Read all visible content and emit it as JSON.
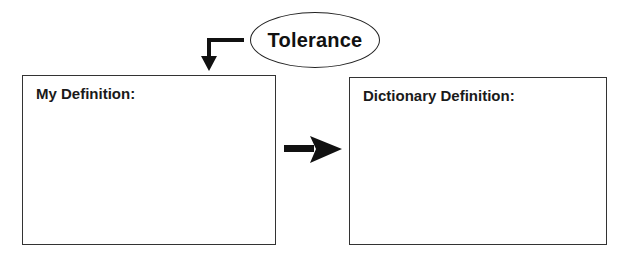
{
  "diagram": {
    "term": {
      "label": "Tolerance"
    },
    "boxes": [
      {
        "id": "my-definition",
        "label": "My Definition:",
        "content": ""
      },
      {
        "id": "dictionary-definition",
        "label": "Dictionary Definition:",
        "content": ""
      }
    ],
    "arrows": [
      {
        "from": "term",
        "to": "my-definition",
        "shape": "elbow-down"
      },
      {
        "from": "my-definition",
        "to": "dictionary-definition",
        "shape": "right"
      }
    ],
    "colors": {
      "stroke": "#111111",
      "background": "#ffffff"
    }
  }
}
